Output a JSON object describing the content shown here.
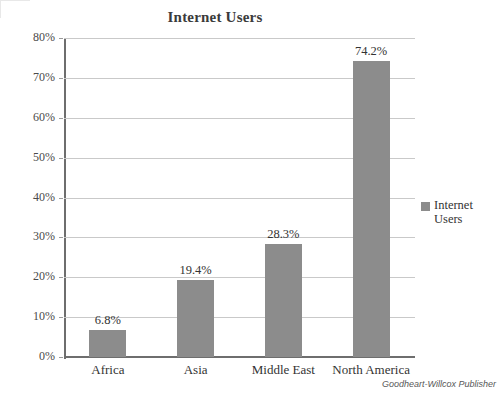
{
  "chart_data": {
    "type": "bar",
    "title": "Internet Users",
    "xlabel": "",
    "ylabel": "",
    "categories": [
      "Africa",
      "Asia",
      "Middle East",
      "North America"
    ],
    "values": [
      6.8,
      19.4,
      28.3,
      74.2
    ],
    "value_labels": [
      "6.8%",
      "19.4%",
      "28.3%",
      "74.2%"
    ],
    "series": [
      {
        "name": "Internet Users",
        "values": [
          6.8,
          19.4,
          28.3,
          74.2
        ],
        "color": "#8c8c8c"
      }
    ],
    "ylim": [
      0,
      80
    ],
    "y_ticks": [
      0,
      10,
      20,
      30,
      40,
      50,
      60,
      70,
      80
    ],
    "y_tick_labels": [
      "0%",
      "10%",
      "20%",
      "30%",
      "40%",
      "50%",
      "60%",
      "70%",
      "80%"
    ],
    "grid": true,
    "grid_axis": "y",
    "legend": {
      "position": "right",
      "entries": [
        "Internet Users"
      ]
    },
    "units": "percent"
  },
  "legend": {
    "label": "Internet Users",
    "swatch_color": "#8c8c8c"
  },
  "credit": {
    "text": "Goodheart-Willcox Publisher"
  },
  "colors": {
    "bar": "#8c8c8c",
    "gridline": "#c9c9c9",
    "axis": "#6e6e6e",
    "text": "#333333"
  }
}
